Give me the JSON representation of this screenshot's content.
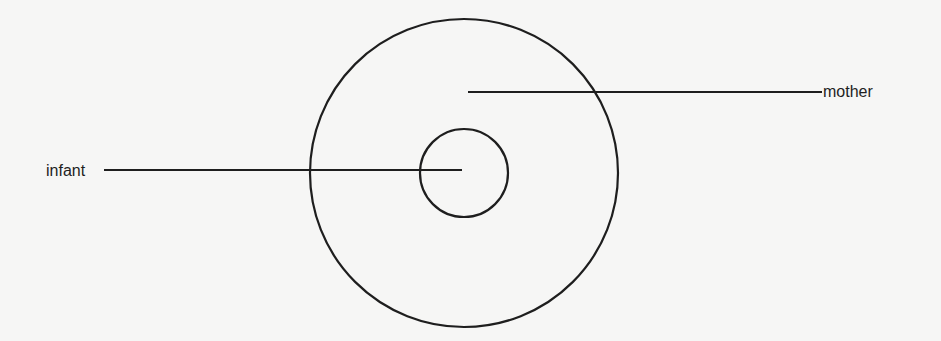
{
  "diagram": {
    "type": "concentric-circles",
    "labels": {
      "infant": "infant",
      "mother": "mother"
    },
    "colors": {
      "background": "#f6f6f5",
      "stroke": "#1e1e1e"
    },
    "shapes": {
      "outer_circle": {
        "cx": 464,
        "cy": 173,
        "r": 154,
        "represents": "mother"
      },
      "inner_circle": {
        "cx": 464,
        "cy": 173,
        "r": 44,
        "represents": "infant"
      }
    },
    "leader_lines": {
      "infant": {
        "x1": 104,
        "y1": 170,
        "x2": 462,
        "y2": 170
      },
      "mother": {
        "x1": 468,
        "y1": 92,
        "x2": 822,
        "y2": 92
      }
    }
  }
}
